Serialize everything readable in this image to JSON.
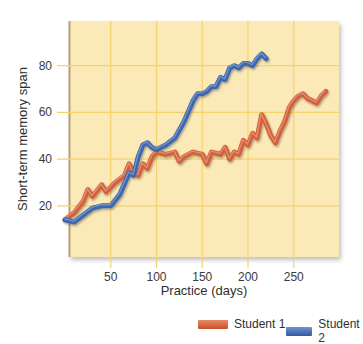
{
  "chart_data": {
    "type": "line",
    "title": "",
    "xlabel": "Practice (days)",
    "ylabel": "Short-term memory span",
    "xlim": [
      0,
      300
    ],
    "ylim": [
      0,
      100
    ],
    "xticks": [
      50,
      100,
      150,
      200,
      250
    ],
    "yticks": [
      20,
      40,
      60,
      80
    ],
    "grid": true,
    "legend_position": "bottom-right",
    "background": "#fbe9b7",
    "grid_color": "#f5d36a",
    "series": [
      {
        "name": "Student 1",
        "color": "#d4613a",
        "x": [
          0,
          10,
          20,
          25,
          30,
          40,
          45,
          50,
          55,
          65,
          70,
          75,
          80,
          85,
          90,
          95,
          100,
          110,
          120,
          125,
          130,
          140,
          150,
          155,
          160,
          170,
          175,
          180,
          185,
          190,
          195,
          200,
          205,
          210,
          215,
          220,
          225,
          230,
          235,
          240,
          245,
          250,
          255,
          260,
          265,
          270,
          275,
          280,
          285
        ],
        "y": [
          14,
          17,
          22,
          27,
          24,
          29,
          26,
          28,
          30,
          33,
          38,
          34,
          33,
          38,
          36,
          41,
          43,
          42,
          43,
          39,
          41,
          43,
          42,
          38,
          43,
          42,
          45,
          40,
          43,
          42,
          48,
          46,
          51,
          49,
          59,
          55,
          50,
          47,
          52,
          56,
          62,
          65,
          67,
          68,
          66,
          65,
          64,
          67,
          69
        ]
      },
      {
        "name": "Student 2",
        "color": "#3d67b0",
        "x": [
          0,
          10,
          20,
          30,
          40,
          50,
          60,
          70,
          75,
          80,
          85,
          90,
          95,
          100,
          110,
          120,
          130,
          140,
          145,
          150,
          155,
          160,
          165,
          170,
          175,
          180,
          185,
          190,
          195,
          200,
          205,
          210,
          215,
          220
        ],
        "y": [
          14,
          13,
          16,
          19,
          20,
          20,
          25,
          34,
          33,
          41,
          46,
          47,
          45,
          44,
          46,
          49,
          56,
          65,
          68,
          68,
          69,
          71,
          71,
          75,
          74,
          79,
          80,
          79,
          81,
          81,
          80,
          83,
          85,
          83
        ]
      }
    ]
  },
  "axes": {
    "x_label": "Practice (days)",
    "y_label": "Short-term memory span",
    "x_ticks": [
      "50",
      "100",
      "150",
      "200",
      "250"
    ],
    "y_ticks": [
      "80",
      "60",
      "40",
      "20"
    ]
  },
  "legend": {
    "items": [
      {
        "label": "Student 1",
        "color": "#d4613a"
      },
      {
        "label": "Student 2",
        "color": "#3d67b0"
      }
    ]
  }
}
